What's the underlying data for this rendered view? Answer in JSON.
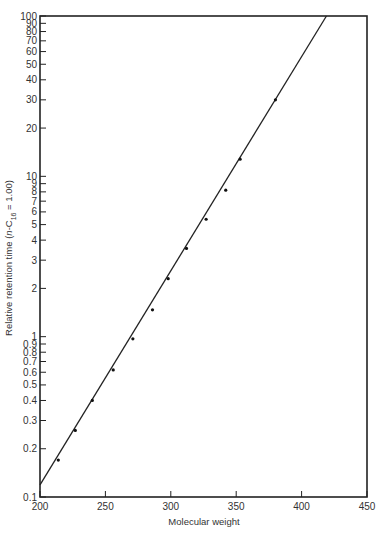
{
  "chart_data": {
    "type": "scatter",
    "title": "",
    "xlabel": "Molecular weight",
    "ylabel": "Relative retention time (n-C16 = 1.00)",
    "ylabel_parts": {
      "main": "Relative retention time (",
      "italic": "n",
      "mid": "-C",
      "sub": "16",
      "tail": " = 1.00)"
    },
    "xlim": [
      200,
      450
    ],
    "ylim": [
      0.1,
      100
    ],
    "yscale": "log",
    "grid": false,
    "legend": null,
    "x_ticks": [
      200,
      250,
      300,
      350,
      400,
      450
    ],
    "x_tick_labels": [
      "200",
      "250",
      "300",
      "350",
      "400",
      "450"
    ],
    "y_ticks": [
      0.1,
      0.2,
      0.3,
      0.4,
      0.5,
      0.6,
      0.7,
      0.8,
      0.9,
      1,
      2,
      3,
      4,
      5,
      6,
      7,
      8,
      9,
      10,
      20,
      30,
      40,
      50,
      60,
      70,
      80,
      90,
      100
    ],
    "y_tick_labels": [
      "0.1",
      "0.2",
      "0.3",
      "0.4",
      "0.5",
      "0.6",
      "0.7",
      "0.8",
      "0.9",
      "1",
      "2",
      "3",
      "4",
      "5",
      "6",
      "7",
      "8",
      "9",
      "10",
      "20",
      "30",
      "40",
      "50",
      "60",
      "70",
      "80",
      "90",
      "100"
    ],
    "series": [
      {
        "name": "measured points",
        "x": [
          214,
          227,
          240,
          256,
          271,
          286,
          298,
          312,
          327,
          342,
          353,
          380
        ],
        "y": [
          0.17,
          0.26,
          0.4,
          0.62,
          0.97,
          1.47,
          2.3,
          3.55,
          5.4,
          8.2,
          12.8,
          30
        ]
      }
    ],
    "fit_line": {
      "x": [
        200,
        419
      ],
      "y": [
        0.119,
        100
      ]
    }
  }
}
